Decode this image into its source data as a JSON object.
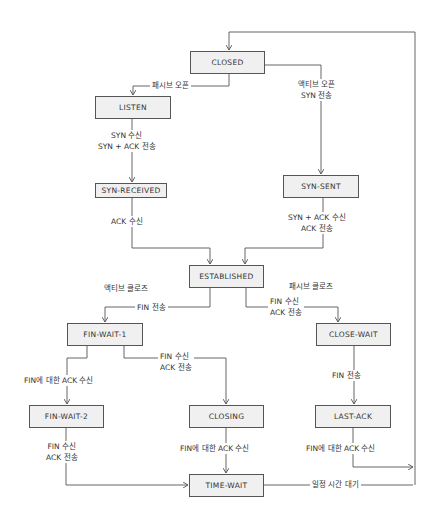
{
  "diagram": {
    "states": [
      {
        "id": "closed",
        "label": "CLOSED"
      },
      {
        "id": "listen",
        "label": "LISTEN"
      },
      {
        "id": "syn_received",
        "label": "SYN-RECEIVED"
      },
      {
        "id": "syn_sent",
        "label": "SYN-SENT"
      },
      {
        "id": "established",
        "label": "ESTABLISHED"
      },
      {
        "id": "fin_wait_1",
        "label": "FIN-WAIT-1"
      },
      {
        "id": "close_wait",
        "label": "CLOSE-WAIT"
      },
      {
        "id": "fin_wait_2",
        "label": "FIN-WAIT-2"
      },
      {
        "id": "closing",
        "label": "CLOSING"
      },
      {
        "id": "last_ack",
        "label": "LAST-ACK"
      },
      {
        "id": "time_wait",
        "label": "TIME-WAIT"
      }
    ],
    "transitions": [
      {
        "from": "CLOSED",
        "to": "LISTEN",
        "lines": [
          "패시브 오픈"
        ]
      },
      {
        "from": "CLOSED",
        "to": "SYN-SENT",
        "lines": [
          "액티브 오픈",
          "SYN 전송"
        ]
      },
      {
        "from": "LISTEN",
        "to": "SYN-RECEIVED",
        "lines": [
          "SYN 수신",
          "SYN + ACK 전송"
        ]
      },
      {
        "from": "SYN-RECEIVED",
        "to": "ESTABLISHED",
        "lines": [
          "ACK 수신"
        ]
      },
      {
        "from": "SYN-SENT",
        "to": "ESTABLISHED",
        "lines": [
          "SYN + ACK 수신",
          "ACK 전송"
        ]
      },
      {
        "from": "ESTABLISHED",
        "to": "FIN-WAIT-1",
        "lines": [
          "FIN 전송"
        ],
        "group": "액티브 클로즈"
      },
      {
        "from": "ESTABLISHED",
        "to": "CLOSE-WAIT",
        "lines": [
          "FIN 수신",
          "ACK 전송"
        ],
        "group": "패시브 클로즈"
      },
      {
        "from": "FIN-WAIT-1",
        "to": "FIN-WAIT-2",
        "lines": [
          "FIN에 대한 ACK 수신"
        ]
      },
      {
        "from": "FIN-WAIT-1",
        "to": "CLOSING",
        "lines": [
          "FIN 수신",
          "ACK 전송"
        ]
      },
      {
        "from": "CLOSE-WAIT",
        "to": "LAST-ACK",
        "lines": [
          "FIN 전송"
        ]
      },
      {
        "from": "FIN-WAIT-2",
        "to": "TIME-WAIT",
        "lines": [
          "FIN 수신",
          "ACK 전송"
        ]
      },
      {
        "from": "CLOSING",
        "to": "TIME-WAIT",
        "lines": [
          "FIN에 대한 ACK 수신"
        ]
      },
      {
        "from": "LAST-ACK",
        "to": "CLOSED",
        "lines": [
          "FIN에 대한 ACK 수신"
        ]
      },
      {
        "from": "TIME-WAIT",
        "to": "CLOSED",
        "lines": [
          "일정 시간 대기"
        ]
      }
    ],
    "group_labels": {
      "active_close": "액티브 클로즈",
      "passive_close": "패시브 클로즈"
    },
    "colors": {
      "box_fill": "#f0f0f0",
      "stroke": "#555555",
      "text": "#333333"
    }
  }
}
